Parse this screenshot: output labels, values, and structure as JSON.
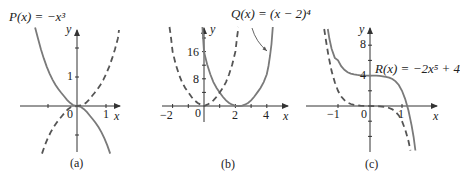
{
  "figure": {
    "panels": [
      {
        "id": "a",
        "caption": "(a)",
        "function_label": "P(x) = −x³",
        "axis_x": "x",
        "axis_y": "y",
        "x_ticks": [
          "0",
          "1"
        ],
        "y_ticks": [
          "1"
        ],
        "solid": "P(x) = -x^3",
        "dashed": "y = x^3"
      },
      {
        "id": "b",
        "caption": "(b)",
        "function_label": "Q(x) = (x − 2)⁴",
        "axis_x": "x",
        "axis_y": "y",
        "x_ticks": [
          "−2",
          "0",
          "2",
          "4"
        ],
        "y_ticks": [
          "8",
          "16"
        ],
        "solid": "Q(x) = (x-2)^4",
        "dashed": "y = x^4"
      },
      {
        "id": "c",
        "caption": "(c)",
        "function_label": "R(x) = −2x⁵ + 4",
        "axis_x": "x",
        "axis_y": "y",
        "x_ticks": [
          "−1",
          "0",
          "1"
        ],
        "y_ticks": [
          "4",
          "8"
        ],
        "solid": "R(x) = -2x^5 + 4",
        "dashed": "y = -2x^5"
      }
    ],
    "colors": {
      "curve": "#7a7a7a",
      "axis": "#333333",
      "text": "#222222"
    }
  }
}
